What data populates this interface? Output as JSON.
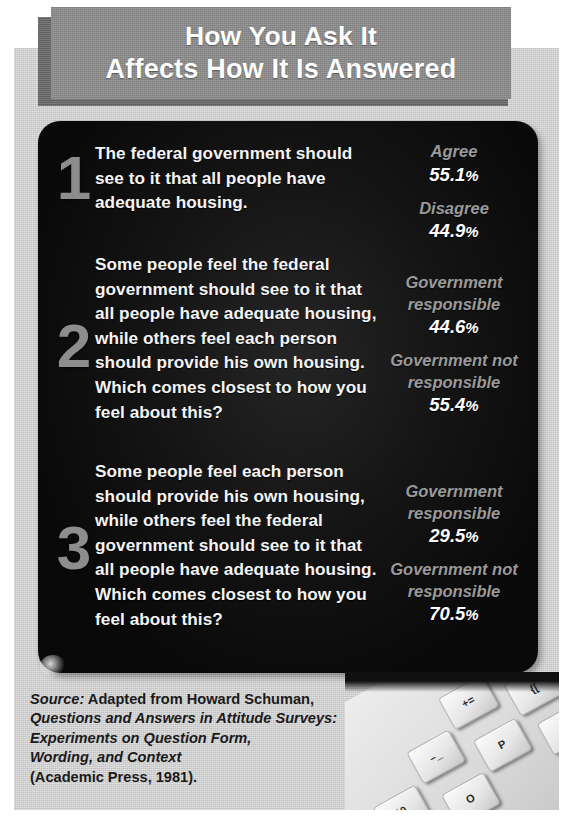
{
  "title": {
    "line1": "How You Ask It",
    "line2": "Affects How It Is Answered"
  },
  "colors": {
    "banner": "#8a8a8a",
    "banner_shadow": "#6b6b6b",
    "page_background": "#cfcfcf",
    "panel_background": "#0d0d0d",
    "question_text": "#f4f4f4",
    "numeral": "#8d8d8d",
    "result_label": "#9a9a9a",
    "result_value": "#ffffff",
    "source_text": "#1a1a1a"
  },
  "questions": [
    {
      "number": "1",
      "text": "The federal government should see to it that all people have adequate housing.",
      "results": [
        {
          "label": "Agree",
          "value": "55.1",
          "unit": "%"
        },
        {
          "label": "Disagree",
          "value": "44.9",
          "unit": "%"
        }
      ]
    },
    {
      "number": "2",
      "text": "Some people feel the federal government should see to it that all people have adequate housing, while others feel each person should provide his own housing. Which comes closest to how you feel about this?",
      "results": [
        {
          "label": "Government responsible",
          "value": "44.6",
          "unit": "%"
        },
        {
          "label": "Government not responsible",
          "value": "55.4",
          "unit": "%"
        }
      ]
    },
    {
      "number": "3",
      "text": "Some people feel each person should provide his own housing, while others feel the federal government should see to it that all people have adequate housing. Which comes closest to how you feel about this?",
      "results": [
        {
          "label": "Government responsible",
          "value": "29.5",
          "unit": "%"
        },
        {
          "label": "Government not responsible",
          "value": "70.5",
          "unit": "%"
        }
      ]
    }
  ],
  "source": {
    "lead": "Source:",
    "line1_rest": " Adapted from Howard Schuman,",
    "line2": "Questions and Answers in Attitude Surveys:",
    "line3": "Experiments on Question Form,",
    "line4": "Wording, and Context",
    "line5": "(Academic Press, 1981)."
  },
  "keyboard": {
    "keys": [
      {
        "id": "delete",
        "label": "delete"
      },
      {
        "id": "plus",
        "label": "+="
      },
      {
        "id": "minus",
        "label": "–_"
      },
      {
        "id": "paren",
        "label": ")0"
      },
      {
        "id": "bracket-open",
        "label": "{["
      },
      {
        "id": "bracket-close",
        "label": "}]"
      },
      {
        "id": "p",
        "label": "P"
      },
      {
        "id": "o",
        "label": "O"
      },
      {
        "id": "semicolon",
        "label": ":;"
      },
      {
        "id": "quote",
        "label": "\"'"
      }
    ]
  },
  "chart_data": {
    "type": "table",
    "title": "How You Ask It Affects How It Is Answered",
    "categories": [
      "Q1 Agree",
      "Q1 Disagree",
      "Q2 Government responsible",
      "Q2 Government not responsible",
      "Q3 Government responsible",
      "Q3 Government not responsible"
    ],
    "values": [
      55.1,
      44.9,
      44.6,
      55.4,
      29.5,
      70.5
    ],
    "xlabel": "Response option",
    "ylabel": "Percent of respondents",
    "ylim": [
      0,
      100
    ]
  }
}
